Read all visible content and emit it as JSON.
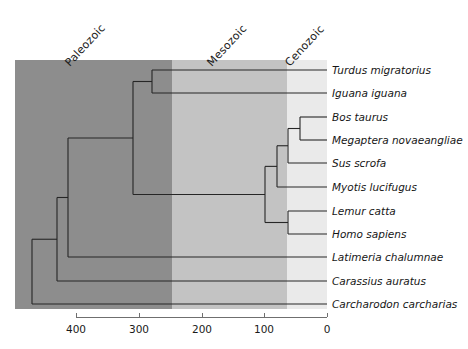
{
  "figure": {
    "plot": {
      "left": 15,
      "top": 60,
      "right": 327,
      "bottom": 309
    },
    "colors": {
      "paleozoic_band": "#8d8d8d",
      "mesozoic_band": "#c3c3c3",
      "cenozoic_band": "#eaeaea",
      "branch_stroke": "#262626",
      "axis_stroke": "#6f6f6f",
      "text": "#161616"
    }
  },
  "eras": [
    {
      "name": "Paleozoic",
      "label": "Paleozoic",
      "start_mya": 541,
      "end_mya": 251,
      "x_start": 15,
      "x_end": 172,
      "label_x": 72,
      "label_y": 56
    },
    {
      "name": "Mesozoic",
      "label": "Mesozoic",
      "start_mya": 251,
      "end_mya": 66,
      "x_start": 172,
      "x_end": 287,
      "label_x": 214,
      "label_y": 56
    },
    {
      "name": "Cenozoic",
      "label": "Cenozoic",
      "start_mya": 66,
      "end_mya": 0,
      "x_start": 287,
      "x_end": 327,
      "label_x": 292,
      "label_y": 56
    }
  ],
  "axis": {
    "label": "Millions of years ago",
    "orientation": "reversed",
    "min": 0,
    "max": 400,
    "y": 317,
    "x_left": 76,
    "x_right": 327,
    "ticks": [
      {
        "value": "400",
        "mya": 400,
        "x": 76
      },
      {
        "value": "300",
        "mya": 300,
        "x": 139
      },
      {
        "value": "200",
        "mya": 200,
        "x": 202
      },
      {
        "value": "100",
        "mya": 100,
        "x": 264
      },
      {
        "value": "0",
        "mya": 0,
        "x": 327
      }
    ]
  },
  "chart_data": {
    "type": "tree",
    "title": "",
    "xlabel": "Millions of years ago",
    "ylabel": "",
    "xlim": [
      400,
      0
    ],
    "grid": false,
    "legend": "none",
    "axis_direction": "right-to-left (present at right)",
    "taxa": [
      {
        "name": "Turdus migratorius",
        "row": 0,
        "y": 70,
        "tip_x": 327,
        "divergence_mya": 279
      },
      {
        "name": "Iguana iguana",
        "row": 1,
        "y": 93,
        "tip_x": 327,
        "divergence_mya": 279
      },
      {
        "name": "Bos taurus",
        "row": 2,
        "y": 117,
        "tip_x": 327,
        "divergence_mya": 62
      },
      {
        "name": "Megaptera novaeangliae",
        "row": 3,
        "y": 140,
        "tip_x": 327,
        "divergence_mya": 62
      },
      {
        "name": "Sus scrofa",
        "row": 4,
        "y": 163,
        "tip_x": 327,
        "divergence_mya": 68
      },
      {
        "name": "Myotis lucifugus",
        "row": 5,
        "y": 187,
        "tip_x": 327,
        "divergence_mya": 80
      },
      {
        "name": "Lemur catta",
        "row": 6,
        "y": 211,
        "tip_x": 327,
        "divergence_mya": 62
      },
      {
        "name": "Homo sapiens",
        "row": 7,
        "y": 234,
        "tip_x": 327,
        "divergence_mya": 62
      },
      {
        "name": "Latimeria chalumnae",
        "row": 8,
        "y": 257,
        "tip_x": 327,
        "divergence_mya": 413
      },
      {
        "name": "Carassius auratus",
        "row": 9,
        "y": 281,
        "tip_x": 327,
        "divergence_mya": 430
      },
      {
        "name": "Carcharodon carcharias",
        "row": 10,
        "y": 304,
        "tip_x": 327,
        "divergence_mya": 470
      }
    ],
    "nodes": [
      {
        "id": "root",
        "x": 32,
        "mya": 470,
        "children_y": [
          211,
          304
        ],
        "label": "gnathostome root"
      },
      {
        "id": "bony-fish",
        "x": 57,
        "mya": 430,
        "children_y": [
          168,
          281
        ],
        "label": "Osteichthyes"
      },
      {
        "id": "tetrapod",
        "x": 68,
        "mya": 413,
        "children_y": [
          131,
          257
        ],
        "label": "Sarcopterygii"
      },
      {
        "id": "amniote",
        "x": 133,
        "mya": 309,
        "children_y": [
          82,
          180
        ],
        "label": "Amniota"
      },
      {
        "id": "reptile",
        "x": 152,
        "mya": 279,
        "children_y": [
          70,
          93
        ],
        "label": "Reptilia"
      },
      {
        "id": "mammal",
        "x": 265,
        "mya": 99,
        "children_y": [
          152,
          222
        ],
        "label": "Mammalia"
      },
      {
        "id": "laurasia",
        "x": 277,
        "mya": 80,
        "children_y": [
          140,
          187
        ],
        "label": "Laurasiatheria"
      },
      {
        "id": "ungulate",
        "x": 288,
        "mya": 62,
        "children_y": [
          128,
          163
        ],
        "label": "Cetartiodactyla + Suina"
      },
      {
        "id": "cetart",
        "x": 300,
        "mya": 43,
        "children_y": [
          117,
          140
        ],
        "label": "Cetartiodactyla"
      },
      {
        "id": "primate",
        "x": 288,
        "mya": 62,
        "children_y": [
          211,
          234
        ],
        "label": "Primates"
      }
    ],
    "branch_segments": [
      {
        "from": "root",
        "to": "bony-fish"
      },
      {
        "from": "root",
        "to": "Carcharodon carcharias"
      },
      {
        "from": "bony-fish",
        "to": "tetrapod"
      },
      {
        "from": "bony-fish",
        "to": "Carassius auratus"
      },
      {
        "from": "tetrapod",
        "to": "amniote"
      },
      {
        "from": "tetrapod",
        "to": "Latimeria chalumnae"
      },
      {
        "from": "amniote",
        "to": "reptile"
      },
      {
        "from": "amniote",
        "to": "mammal"
      },
      {
        "from": "reptile",
        "to": "Turdus migratorius"
      },
      {
        "from": "reptile",
        "to": "Iguana iguana"
      },
      {
        "from": "mammal",
        "to": "laurasia"
      },
      {
        "from": "mammal",
        "to": "primate"
      },
      {
        "from": "laurasia",
        "to": "ungulate"
      },
      {
        "from": "laurasia",
        "to": "Myotis lucifugus"
      },
      {
        "from": "ungulate",
        "to": "cetart"
      },
      {
        "from": "ungulate",
        "to": "Sus scrofa"
      },
      {
        "from": "cetart",
        "to": "Bos taurus"
      },
      {
        "from": "cetart",
        "to": "Megaptera novaeangliae"
      },
      {
        "from": "primate",
        "to": "Lemur catta"
      },
      {
        "from": "primate",
        "to": "Homo sapiens"
      }
    ]
  }
}
